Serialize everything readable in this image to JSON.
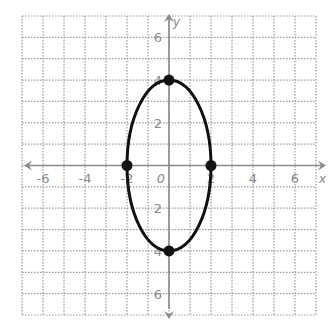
{
  "chart_data": {
    "type": "line",
    "title": "",
    "xlabel": "x",
    "ylabel": "y",
    "xlim": [
      -7,
      7
    ],
    "ylim": [
      -7,
      7
    ],
    "grid": true,
    "grid_style": "dotted",
    "x_ticks": [
      -6,
      -4,
      -2,
      0,
      2,
      4,
      6
    ],
    "y_ticks": [
      6,
      4,
      2,
      -2,
      -4,
      -6
    ],
    "x_tick_labels": [
      "-6",
      "-4",
      "-2",
      "0",
      "2",
      "4",
      "6"
    ],
    "y_tick_labels": [
      "6",
      "4",
      "2",
      "2",
      "4",
      "6"
    ],
    "series": [
      {
        "name": "ellipse",
        "shape": "ellipse",
        "center": [
          0,
          0
        ],
        "semi_axis_x": 2,
        "semi_axis_y": 4,
        "color": "#111111"
      }
    ],
    "points": [
      {
        "x": 0,
        "y": 4
      },
      {
        "x": 0,
        "y": -4
      },
      {
        "x": -2,
        "y": 0
      },
      {
        "x": 2,
        "y": 0
      }
    ],
    "axis_labels": {
      "x": "x",
      "y": "y"
    },
    "colors": {
      "grid": "#9a9a9a",
      "axis": "#8a8a8a",
      "curve": "#111111",
      "labels": "#8a8a8a"
    }
  }
}
